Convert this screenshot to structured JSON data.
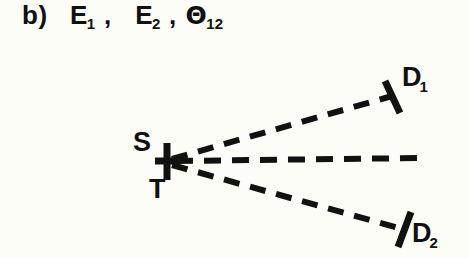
{
  "figure": {
    "panel_label": "b)",
    "caption_parts": [
      {
        "base": "E",
        "sub": "1"
      },
      {
        "base": "E",
        "sub": "2"
      },
      {
        "base": "Θ",
        "sub": "12"
      }
    ],
    "caption_text": "b) E1, E2, Θ12",
    "separator": ","
  },
  "diagram": {
    "type": "scattering-geometry",
    "background_color": "#fdfdf8",
    "ink_color": "#111111",
    "vertex": {
      "name": "source-target-point",
      "x": 168,
      "y": 161,
      "marker": "cross-marker",
      "labels": {
        "above": "S",
        "below": "T"
      }
    },
    "rays": [
      {
        "id": "ray-upper",
        "name": "ray-to-detector-1",
        "style": "dashed",
        "from": {
          "x": 172,
          "y": 159
        },
        "to": {
          "x": 392,
          "y": 96
        },
        "endpoint_label": {
          "base": "D",
          "sub": "1"
        },
        "end_marker": "perpendicular-tick"
      },
      {
        "id": "ray-axis",
        "name": "central-axis-ray",
        "style": "dashed",
        "from": {
          "x": 176,
          "y": 161
        },
        "to": {
          "x": 420,
          "y": 158
        },
        "endpoint_label": null,
        "end_marker": "none"
      },
      {
        "id": "ray-lower",
        "name": "ray-to-detector-2",
        "style": "dashed",
        "from": {
          "x": 172,
          "y": 165
        },
        "to": {
          "x": 402,
          "y": 229
        },
        "endpoint_label": {
          "base": "D",
          "sub": "2"
        },
        "end_marker": "perpendicular-tick"
      }
    ],
    "detectors": [
      {
        "id": "D1",
        "label_base": "D",
        "label_sub": "1",
        "x": 402,
        "y": 64
      },
      {
        "id": "D2",
        "label_base": "D",
        "label_sub": "2",
        "x": 412,
        "y": 220
      }
    ]
  }
}
